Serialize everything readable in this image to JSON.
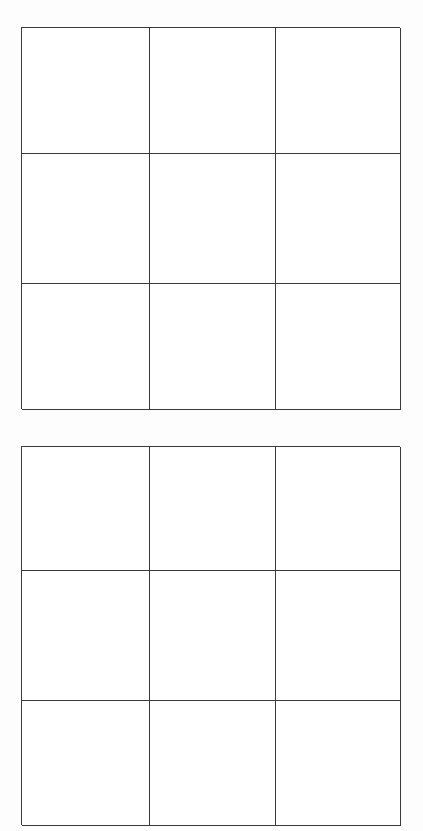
{
  "document": {
    "background_color": "#fdfdfd",
    "line_color": "#3a3a3a",
    "cell_fill_color": "#ffffff",
    "width_px": 423,
    "height_px": 831
  },
  "grids": [
    {
      "id": "grid-1",
      "name": "upper-grid",
      "rows": 3,
      "columns": 3,
      "cells": [
        {
          "row": 1,
          "column": 1,
          "text": ""
        },
        {
          "row": 1,
          "column": 2,
          "text": ""
        },
        {
          "row": 1,
          "column": 3,
          "text": ""
        },
        {
          "row": 2,
          "column": 1,
          "text": ""
        },
        {
          "row": 2,
          "column": 2,
          "text": ""
        },
        {
          "row": 2,
          "column": 3,
          "text": ""
        },
        {
          "row": 3,
          "column": 1,
          "text": ""
        },
        {
          "row": 3,
          "column": 2,
          "text": ""
        },
        {
          "row": 3,
          "column": 3,
          "text": ""
        }
      ]
    },
    {
      "id": "grid-2",
      "name": "lower-grid",
      "rows": 3,
      "columns": 3,
      "cells": [
        {
          "row": 1,
          "column": 1,
          "text": ""
        },
        {
          "row": 1,
          "column": 2,
          "text": ""
        },
        {
          "row": 1,
          "column": 3,
          "text": ""
        },
        {
          "row": 2,
          "column": 1,
          "text": ""
        },
        {
          "row": 2,
          "column": 2,
          "text": ""
        },
        {
          "row": 2,
          "column": 3,
          "text": ""
        },
        {
          "row": 3,
          "column": 1,
          "text": ""
        },
        {
          "row": 3,
          "column": 2,
          "text": ""
        },
        {
          "row": 3,
          "column": 3,
          "text": ""
        }
      ]
    }
  ]
}
